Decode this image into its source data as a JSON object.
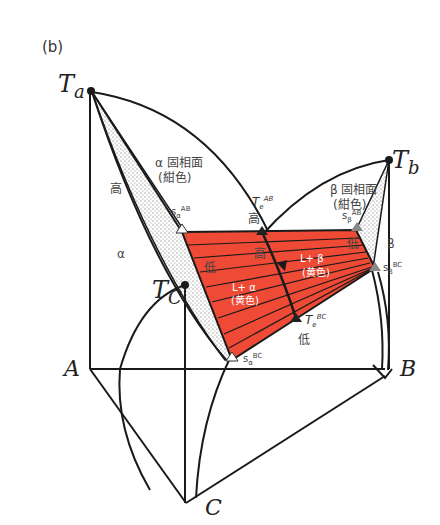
{
  "figure": {
    "panel_label": "(b)",
    "vertices": {
      "Ta": "T",
      "Ta_sub": "a",
      "Tb": "T",
      "Tb_sub": "b",
      "Tc": "T",
      "Tc_sub": "C",
      "A": "A",
      "B": "B",
      "C": "C"
    },
    "phases": {
      "alpha": "α",
      "beta": "β",
      "l_alpha": "L+ α",
      "l_alpha_color": "(黄色)",
      "l_beta": "L+ β",
      "l_beta_color": "(黄色)"
    },
    "surfaces": {
      "alpha_solidus": "α 固相面",
      "alpha_solidus_color": "(紺色)",
      "beta_solidus": "β 固相面",
      "beta_solidus_color": "(紺色)"
    },
    "points": {
      "s_alpha_ab": "s",
      "s_alpha_ab_sub": "α",
      "s_alpha_ab_sup": "AB",
      "s_alpha_bc": "s",
      "s_alpha_bc_sub": "α",
      "s_alpha_bc_sup": "BC",
      "s_beta_ab": "s",
      "s_beta_ab_sub": "β",
      "s_beta_ab_sup": "AB",
      "s_beta_bc": "s",
      "s_beta_bc_sub": "β",
      "s_beta_bc_sup": "BC",
      "te_ab": "T",
      "te_ab_sub": "e",
      "te_ab_sup": "AB",
      "te_bc": "T",
      "te_bc_sub": "e",
      "te_bc_sup": "BC"
    },
    "markers": {
      "high": "高",
      "low": "低"
    },
    "colors": {
      "liquid_region": "#ee4a35",
      "line": "#1a1a1a",
      "stipple": "#666666"
    }
  }
}
